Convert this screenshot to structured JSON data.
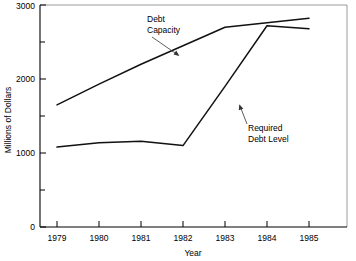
{
  "chart_data": {
    "type": "line",
    "title": "",
    "xlabel": "Year",
    "ylabel": "Millions of Dollars",
    "x": [
      1979,
      1980,
      1981,
      1982,
      1983,
      1984,
      1985
    ],
    "xtick_labels": [
      "1979",
      "1980",
      "1981",
      "1982",
      "1983",
      "1984",
      "1985"
    ],
    "ytick_labels": [
      "0",
      "1000",
      "2000",
      "3000"
    ],
    "ytick_values": [
      0,
      1000,
      2000,
      3000
    ],
    "yminor_values": [
      500,
      1500,
      2500
    ],
    "xlim": [
      1979,
      1985
    ],
    "ylim": [
      0,
      3000
    ],
    "grid": false,
    "legend_position": "inline-annotations",
    "series": [
      {
        "name": "Debt Capacity",
        "color": "#111111",
        "values": [
          1650,
          1930,
          2200,
          2450,
          2700,
          2760,
          2820
        ]
      },
      {
        "name": "Required Debt Level",
        "color": "#111111",
        "values": [
          1080,
          1140,
          1160,
          1100,
          1900,
          2720,
          2680
        ]
      }
    ],
    "annotations": [
      {
        "label": "Debt Capacity",
        "line1": "Debt",
        "line2": "Capacity"
      },
      {
        "label": "Required Debt Level",
        "line1": "Required",
        "line2": "Debt Level"
      }
    ]
  }
}
